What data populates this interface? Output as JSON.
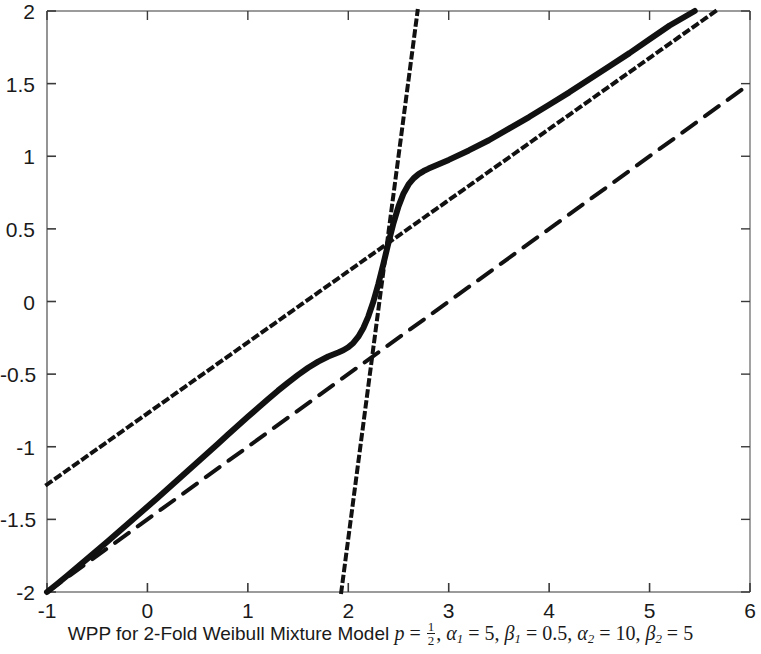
{
  "caption": {
    "prefix": "WPP for 2-Fold Weibull Mixture Model ",
    "p_symbol": "p",
    "eq1": " = ",
    "p_num": "1",
    "p_den": "2",
    "comma1": ", ",
    "alpha1_symbol": "α",
    "alpha1_sub": "1",
    "eq2": " = ",
    "alpha1_value": "5",
    "comma2": ", ",
    "beta1_symbol": "β",
    "beta1_sub": "1",
    "eq3": " = ",
    "beta1_value": "0.5",
    "comma3": ", ",
    "alpha2_symbol": "α",
    "alpha2_sub": "2",
    "eq4": " = ",
    "alpha2_value": "10",
    "comma4": ", ",
    "beta2_symbol": "β",
    "beta2_sub": "2",
    "eq5": " = ",
    "beta2_value": "5",
    "full_text": "WPP for 2-Fold Weibull Mixture Model p = 1/2, α1 = 5, β1 = 0.5, α2 = 10, β2 = 5"
  },
  "chart_data": {
    "type": "line",
    "xlabel": "",
    "ylabel": "",
    "xlim": [
      -1,
      6
    ],
    "ylim": [
      -2,
      2
    ],
    "xticks": [
      -1,
      0,
      1,
      2,
      3,
      4,
      5,
      6
    ],
    "xticklabels": [
      "-1",
      "0",
      "1",
      "2",
      "3",
      "4",
      "5",
      "6"
    ],
    "yticks": [
      -2,
      -1.5,
      -1,
      -0.5,
      0,
      0.5,
      1,
      1.5,
      2
    ],
    "yticklabels": [
      "-2",
      "-1.5",
      "-1",
      "-0.5",
      "0",
      "0.5",
      "1",
      "1.5",
      "2"
    ],
    "grid": false,
    "legend": null,
    "axis_color": "#7a7a7a",
    "line_color": "#111111",
    "parameters": {
      "p": 0.5,
      "alpha_1": 5,
      "beta_1": 0.5,
      "alpha_2": 10,
      "beta_2": 5
    },
    "series": [
      {
        "name": "mixture-wpp",
        "style": "solid",
        "linewidth": 6,
        "color": "#111111",
        "points": [
          [
            -1.0,
            -2.0
          ],
          [
            -0.9,
            -1.945
          ],
          [
            -0.8,
            -1.888
          ],
          [
            -0.7,
            -1.83
          ],
          [
            -0.6,
            -1.772
          ],
          [
            -0.5,
            -1.713
          ],
          [
            -0.4,
            -1.654
          ],
          [
            -0.3,
            -1.594
          ],
          [
            -0.2,
            -1.534
          ],
          [
            -0.1,
            -1.474
          ],
          [
            0.0,
            -1.413
          ],
          [
            0.1,
            -1.352
          ],
          [
            0.2,
            -1.291
          ],
          [
            0.3,
            -1.229
          ],
          [
            0.4,
            -1.167
          ],
          [
            0.5,
            -1.105
          ],
          [
            0.6,
            -1.043
          ],
          [
            0.7,
            -0.981
          ],
          [
            0.8,
            -0.918
          ],
          [
            0.9,
            -0.856
          ],
          [
            1.0,
            -0.794
          ],
          [
            1.1,
            -0.733
          ],
          [
            1.2,
            -0.673
          ],
          [
            1.3,
            -0.614
          ],
          [
            1.4,
            -0.558
          ],
          [
            1.5,
            -0.505
          ],
          [
            1.6,
            -0.456
          ],
          [
            1.7,
            -0.414
          ],
          [
            1.8,
            -0.379
          ],
          [
            1.9,
            -0.351
          ],
          [
            1.95,
            -0.336
          ],
          [
            2.0,
            -0.315
          ],
          [
            2.05,
            -0.285
          ],
          [
            2.1,
            -0.242
          ],
          [
            2.15,
            -0.182
          ],
          [
            2.2,
            -0.102
          ],
          [
            2.25,
            0.0
          ],
          [
            2.3,
            0.122
          ],
          [
            2.35,
            0.26
          ],
          [
            2.4,
            0.404
          ],
          [
            2.45,
            0.54
          ],
          [
            2.5,
            0.655
          ],
          [
            2.55,
            0.744
          ],
          [
            2.6,
            0.806
          ],
          [
            2.65,
            0.848
          ],
          [
            2.7,
            0.877
          ],
          [
            2.75,
            0.898
          ],
          [
            2.8,
            0.915
          ],
          [
            2.9,
            0.945
          ],
          [
            3.0,
            0.975
          ],
          [
            3.2,
            1.04
          ],
          [
            3.4,
            1.11
          ],
          [
            3.6,
            1.19
          ],
          [
            3.8,
            1.27
          ],
          [
            4.0,
            1.355
          ],
          [
            4.2,
            1.44
          ],
          [
            4.4,
            1.53
          ],
          [
            4.6,
            1.62
          ],
          [
            4.8,
            1.71
          ],
          [
            5.0,
            1.805
          ],
          [
            5.2,
            1.9
          ],
          [
            5.45,
            2.0
          ]
        ]
      },
      {
        "name": "asymptote-dashed",
        "style": "dashed",
        "linewidth": 4,
        "color": "#111111",
        "points": [
          [
            -1.0,
            -2.0
          ],
          [
            6.0,
            1.5
          ]
        ],
        "slope": 0.5
      },
      {
        "name": "asymptote-dotted-shallow",
        "style": "dotted",
        "linewidth": 4,
        "color": "#111111",
        "points": [
          [
            -1.0,
            -1.26
          ],
          [
            5.66,
            2.0
          ]
        ],
        "slope": 0.49
      },
      {
        "name": "asymptote-dotted-steep",
        "style": "dotted",
        "linewidth": 4,
        "color": "#111111",
        "points": [
          [
            1.93,
            -2.0
          ],
          [
            2.69,
            2.0
          ]
        ],
        "slope": 5.26
      }
    ]
  }
}
